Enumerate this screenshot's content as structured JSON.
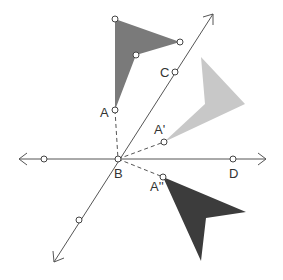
{
  "diagram": {
    "type": "reflection",
    "colors": {
      "original": "#7a7a7a",
      "reflection_1": "#c8c8c8",
      "reflection_2": "#3c3c3c",
      "line": "#555555"
    },
    "points": {
      "A": {
        "label": "A",
        "x": 115,
        "y": 110
      },
      "A_prime": {
        "label": "A'",
        "x": 164,
        "y": 142
      },
      "A_double_prime": {
        "label": "A''",
        "x": 163,
        "y": 177
      },
      "B": {
        "label": "B",
        "x": 118,
        "y": 159
      },
      "C": {
        "label": "C",
        "x": 175,
        "y": 72
      },
      "D": {
        "label": "D",
        "x": 233,
        "y": 159
      }
    },
    "lines": [
      {
        "name": "line-BD",
        "through": [
          "B",
          "D"
        ],
        "arrows": "both"
      },
      {
        "name": "line-BC",
        "through": [
          "B",
          "C"
        ],
        "arrows": "both"
      }
    ],
    "shapes": [
      {
        "name": "original-figure",
        "vertex": "A"
      },
      {
        "name": "image-A-prime",
        "vertex": "A'"
      },
      {
        "name": "image-A-double-prime",
        "vertex": "A''"
      }
    ]
  }
}
